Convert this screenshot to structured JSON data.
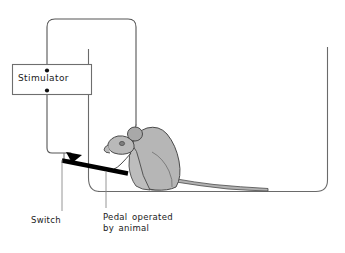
{
  "figure": {
    "type": "apparatus-diagram",
    "background_color": "#ffffff"
  },
  "labels": {
    "stimulator": "Stimulator",
    "switch": "Switch",
    "pedal_line1": "Pedal operated",
    "pedal_line2": "by animal"
  },
  "parts": {
    "stimulator_box": {
      "name": "stimulator",
      "border_color": "#6e6e6e",
      "fill": "#ffffff"
    },
    "terminal_top": {
      "name": "top-terminal",
      "color": "#111111"
    },
    "terminal_bottom": {
      "name": "bottom-terminal",
      "color": "#111111"
    },
    "wire": {
      "name": "stimulating-wire",
      "color": "#555555"
    },
    "cage": {
      "name": "cage-outline",
      "color": "#6a6a6a"
    },
    "pedal": {
      "name": "pedal-lever",
      "color": "#000000"
    },
    "switch": {
      "name": "switch-contact",
      "color": "#000000"
    },
    "animal": {
      "name": "rat",
      "body_fill": "#b6b6b6",
      "outline": "#4a4a4a",
      "ear_fill": "#a8a8a8",
      "tail_fill": "#b0b0b0"
    },
    "leader_lines": {
      "name": "label-leader-lines",
      "color": "#8a8a8a"
    }
  }
}
